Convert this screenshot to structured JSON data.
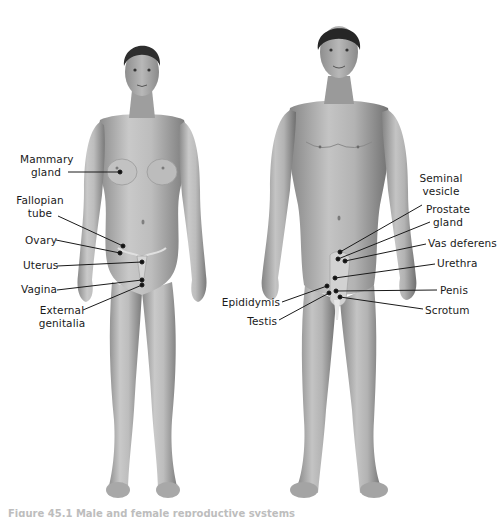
{
  "figure": {
    "caption": "Figure 45.1 Male and female reproductive systems",
    "colors": {
      "background": "#ffffff",
      "skin_light": "#cfcfcf",
      "skin_dark": "#7d7d7d",
      "hair": "#2a2a2a",
      "label_text": "#1a1a1a",
      "leader_line": "#1a1a1a"
    }
  },
  "female": {
    "name": "Female figure",
    "labels": [
      {
        "id": "mammary-gland",
        "line1": "Mammary",
        "line2": "gland"
      },
      {
        "id": "fallopian-tube",
        "line1": "Fallopian",
        "line2": "tube"
      },
      {
        "id": "ovary",
        "line1": "Ovary",
        "line2": ""
      },
      {
        "id": "uterus",
        "line1": "Uterus",
        "line2": ""
      },
      {
        "id": "vagina",
        "line1": "Vagina",
        "line2": ""
      },
      {
        "id": "external-genitalia",
        "line1": "External",
        "line2": "genitalia"
      }
    ]
  },
  "male": {
    "name": "Male figure",
    "labels": [
      {
        "id": "seminal-vesicle",
        "line1": "Seminal",
        "line2": "vesicle"
      },
      {
        "id": "prostate-gland",
        "line1": "Prostate",
        "line2": "gland"
      },
      {
        "id": "vas-deferens",
        "line1": "Vas deferens",
        "line2": ""
      },
      {
        "id": "urethra",
        "line1": "Urethra",
        "line2": ""
      },
      {
        "id": "penis",
        "line1": "Penis",
        "line2": ""
      },
      {
        "id": "scrotum",
        "line1": "Scrotum",
        "line2": ""
      },
      {
        "id": "epididymis",
        "line1": "Epididymis",
        "line2": ""
      },
      {
        "id": "testis",
        "line1": "Testis",
        "line2": ""
      }
    ]
  }
}
